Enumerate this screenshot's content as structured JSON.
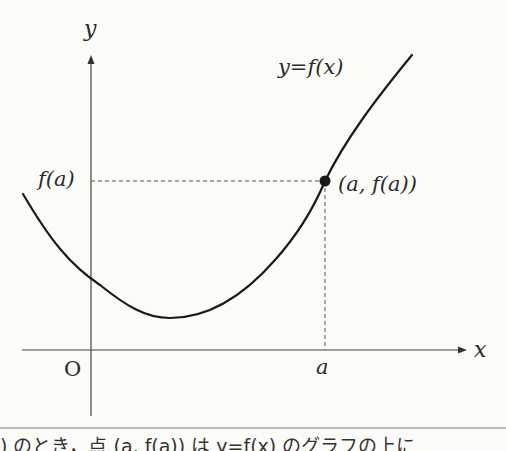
{
  "diagram": {
    "type": "function-graph",
    "labels": {
      "y_axis": "y",
      "x_axis": "x",
      "origin": "O",
      "curve": "y=f(x)",
      "point": "(a, f(a))",
      "y_tick": "f(a)",
      "x_tick": "a"
    },
    "axes": {
      "origin_px": [
        91,
        350
      ],
      "x_axis_px": [
        22,
        466
      ],
      "y_axis_px": [
        57,
        416
      ]
    },
    "curve_points_px": [
      [
        23,
        194
      ],
      [
        91,
        278
      ],
      [
        168,
        318
      ],
      [
        250,
        272
      ],
      [
        325,
        181
      ],
      [
        412,
        55
      ]
    ],
    "point_px": [
      325,
      181
    ],
    "dashed_guides": {
      "horizontal": {
        "from": [
          91,
          181
        ],
        "to": [
          325,
          181
        ]
      },
      "vertical": {
        "from": [
          325,
          181
        ],
        "to": [
          325,
          350
        ]
      }
    },
    "colors": {
      "curve": "#1a1a1a",
      "axis": "#444444",
      "dashed": "#555555",
      "background": "#fbfbf8"
    }
  },
  "caption": {
    "text": ") のとき，点 (a, f(a)) は y=f(x) のグラフの上に"
  }
}
